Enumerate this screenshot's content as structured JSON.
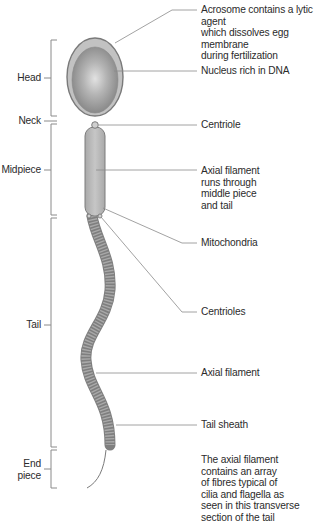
{
  "figure": {
    "colors": {
      "line": "#8a8a8a",
      "head_outer": "#9a9a9a",
      "acrosome": "#c4c4c4",
      "nucleus_center": "#d8d8d8",
      "nucleus_edge": "#8f8f8f",
      "midpiece": "#b7b7b7",
      "tail": "#a3a3a3",
      "text": "#2b2b2b"
    }
  },
  "regions": [
    {
      "id": "head",
      "label": "Head"
    },
    {
      "id": "neck",
      "label": "Neck"
    },
    {
      "id": "midpiece",
      "label": "Midpiece"
    },
    {
      "id": "tail",
      "label": "Tail"
    },
    {
      "id": "end-piece",
      "label": "End\npiece"
    }
  ],
  "annotations": [
    {
      "id": "acrosome",
      "text": "Acrosome contains a lytic agent\nwhich dissolves egg membrane\nduring fertilization"
    },
    {
      "id": "nucleus",
      "text": "Nucleus rich in DNA"
    },
    {
      "id": "centriole",
      "text": "Centriole"
    },
    {
      "id": "axial-filament-midpiece",
      "text": "Axial filament\nruns through\nmiddle piece\nand tail"
    },
    {
      "id": "mitochondria",
      "text": "Mitochondria"
    },
    {
      "id": "centrioles",
      "text": "Centrioles"
    },
    {
      "id": "axial-filament-tail",
      "text": "Axial filament"
    },
    {
      "id": "tail-sheath",
      "text": "Tail sheath"
    },
    {
      "id": "transverse-note",
      "text": "The axial filament\ncontains an array\nof fibres typical of\ncilia and flagella as\nseen in this transverse\nsection of the tail"
    }
  ]
}
